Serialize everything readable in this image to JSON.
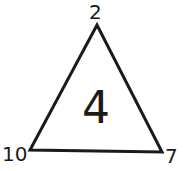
{
  "diagram": {
    "shape": "triangle",
    "center_value": "4",
    "vertices": {
      "top": "2",
      "bottom_left": "10",
      "bottom_right": "7"
    },
    "stroke_color": "#1a1a1a",
    "background": "#ffffff"
  }
}
